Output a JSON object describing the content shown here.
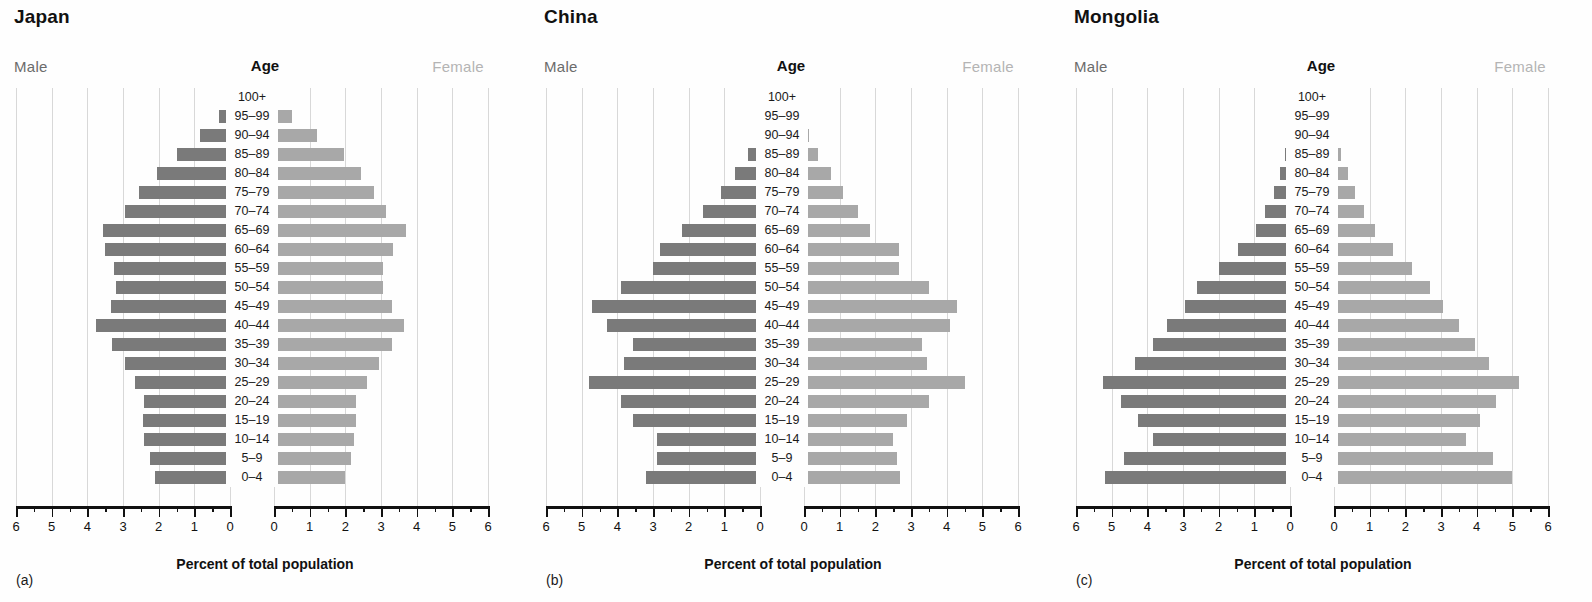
{
  "figure": {
    "x_axis_title": "Percent of total population",
    "male_label": "Male",
    "female_label": "Female",
    "age_header": "Age",
    "male_color": "#7a7a7a",
    "female_color": "#a8a8a8",
    "grid_color": "#d8d8d8"
  },
  "age_groups": [
    "0–4",
    "5–9",
    "10–14",
    "15–19",
    "20–24",
    "25–29",
    "30–34",
    "35–39",
    "40–44",
    "45–49",
    "50–54",
    "55–59",
    "60–64",
    "65–69",
    "70–74",
    "75–79",
    "80–84",
    "85–89",
    "90–94",
    "95–99",
    "100+"
  ],
  "panels": [
    {
      "key": "japan",
      "title": "Japan",
      "panel_label": "(a)"
    },
    {
      "key": "china",
      "title": "China",
      "panel_label": "(b)"
    },
    {
      "key": "mongolia",
      "title": "Mongolia",
      "panel_label": "(c)"
    }
  ],
  "axis_ticks_left": [
    "6",
    "5",
    "4",
    "3",
    "2",
    "1",
    "0"
  ],
  "axis_ticks_right": [
    "0",
    "1",
    "2",
    "3",
    "4",
    "5",
    "6"
  ],
  "chart_data": [
    {
      "type": "bar",
      "title": "Japan",
      "subtype": "population-pyramid",
      "xlabel": "Percent of total population",
      "ylabel": "Age",
      "xlim": [
        0,
        6
      ],
      "grid": true,
      "legend": [
        "Male",
        "Female"
      ],
      "categories": [
        "0–4",
        "5–9",
        "10–14",
        "15–19",
        "20–24",
        "25–29",
        "30–34",
        "35–39",
        "40–44",
        "45–49",
        "50–54",
        "55–59",
        "60–64",
        "65–69",
        "70–74",
        "75–79",
        "80–84",
        "85–89",
        "90–94",
        "95–99",
        "100+"
      ],
      "series": [
        {
          "name": "Male",
          "values": [
            2.1,
            2.25,
            2.4,
            2.45,
            2.4,
            2.65,
            2.95,
            3.3,
            3.75,
            3.35,
            3.2,
            3.25,
            3.5,
            3.55,
            2.95,
            2.55,
            2.05,
            1.5,
            0.85,
            0.3,
            0.05
          ]
        },
        {
          "name": "Female",
          "values": [
            2.0,
            2.15,
            2.25,
            2.3,
            2.3,
            2.6,
            2.95,
            3.3,
            3.65,
            3.3,
            3.05,
            3.05,
            3.35,
            3.7,
            3.15,
            2.8,
            2.45,
            1.95,
            1.2,
            0.5,
            0.1
          ]
        }
      ]
    },
    {
      "type": "bar",
      "title": "China",
      "subtype": "population-pyramid",
      "xlabel": "Percent of total population",
      "ylabel": "Age",
      "xlim": [
        0,
        6
      ],
      "grid": true,
      "legend": [
        "Male",
        "Female"
      ],
      "categories": [
        "0–4",
        "5–9",
        "10–14",
        "15–19",
        "20–24",
        "25–29",
        "30–34",
        "35–39",
        "40–44",
        "45–49",
        "50–54",
        "55–59",
        "60–64",
        "65–69",
        "70–74",
        "75–79",
        "80–84",
        "85–89",
        "90–94",
        "95–99",
        "100+"
      ],
      "series": [
        {
          "name": "Male",
          "values": [
            3.2,
            2.9,
            2.9,
            3.55,
            3.9,
            4.8,
            3.8,
            3.55,
            4.3,
            4.7,
            3.9,
            3.0,
            2.8,
            2.2,
            1.6,
            1.1,
            0.7,
            0.35,
            0.12,
            0.03,
            0.0
          ]
        },
        {
          "name": "Female",
          "values": [
            2.7,
            2.6,
            2.5,
            2.9,
            3.5,
            4.5,
            3.45,
            3.3,
            4.1,
            4.3,
            3.5,
            2.65,
            2.65,
            1.85,
            1.5,
            1.1,
            0.75,
            0.4,
            0.15,
            0.04,
            0.0
          ]
        }
      ]
    },
    {
      "type": "bar",
      "title": "Mongolia",
      "subtype": "population-pyramid",
      "xlabel": "Percent of total population",
      "ylabel": "Age",
      "xlim": [
        0,
        6
      ],
      "grid": true,
      "legend": [
        "Male",
        "Female"
      ],
      "categories": [
        "0–4",
        "5–9",
        "10–14",
        "15–19",
        "20–24",
        "25–29",
        "30–34",
        "35–39",
        "40–44",
        "45–49",
        "50–54",
        "55–59",
        "60–64",
        "65–69",
        "70–74",
        "75–79",
        "80–84",
        "85–89",
        "90–94",
        "95–99",
        "100+"
      ],
      "series": [
        {
          "name": "Male",
          "values": [
            5.2,
            4.65,
            3.85,
            4.25,
            4.75,
            5.25,
            4.35,
            3.85,
            3.45,
            2.95,
            2.6,
            2.0,
            1.45,
            0.95,
            0.7,
            0.45,
            0.28,
            0.15,
            0.06,
            0.02,
            0.0
          ]
        },
        {
          "name": "Female",
          "values": [
            5.0,
            4.45,
            3.7,
            4.1,
            4.55,
            5.2,
            4.35,
            3.95,
            3.5,
            3.05,
            2.7,
            2.2,
            1.65,
            1.15,
            0.85,
            0.6,
            0.4,
            0.2,
            0.08,
            0.03,
            0.0
          ]
        }
      ]
    }
  ]
}
